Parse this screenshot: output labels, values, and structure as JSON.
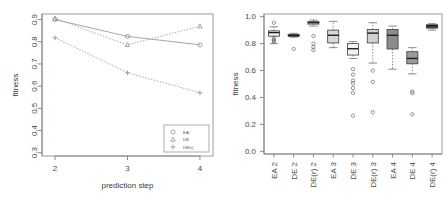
{
  "figure": {
    "background": "#ffffff",
    "panels": [
      "line-chart",
      "box-plot"
    ]
  },
  "chart_data": [
    {
      "type": "line",
      "title": "",
      "xlabel": "prediction step",
      "ylabel": "fitness",
      "x": [
        2,
        3,
        4
      ],
      "xticks": [
        "2",
        "3",
        "4"
      ],
      "yticks": [
        "0.3",
        "0.4",
        "0.5",
        "0.6",
        "0.7",
        "0.8",
        "0.9"
      ],
      "xlim": [
        1.82,
        4.18
      ],
      "ylim": [
        0.285,
        0.925
      ],
      "grid": false,
      "legend_position": "bottom-right",
      "series": [
        {
          "name": "EA",
          "values": [
            0.9,
            0.824,
            0.786
          ],
          "style": "solid",
          "marker": "circle"
        },
        {
          "name": "DE",
          "values": [
            0.905,
            0.786,
            0.87
          ],
          "style": "dotted",
          "marker": "triangle"
        },
        {
          "name": "DE(r)",
          "values": [
            0.818,
            0.66,
            0.57
          ],
          "style": "dotted",
          "marker": "plus"
        }
      ]
    },
    {
      "type": "box",
      "title": "",
      "xlabel": "",
      "ylabel": "fitness",
      "yticks": [
        "0.0",
        "0.2",
        "0.4",
        "0.6",
        "0.8",
        "1.0"
      ],
      "ylim": [
        -0.02,
        1.02
      ],
      "grid": false,
      "categories": [
        "EA 2",
        "DE 2",
        "DE(r) 2",
        "EA 3",
        "DE 3",
        "DE(r) 3",
        "EA 4",
        "DE 4",
        "DE(r) 4"
      ],
      "boxes": [
        {
          "label": "EA 2",
          "min": 0.8,
          "q1": 0.855,
          "median": 0.882,
          "q3": 0.895,
          "max": 0.925,
          "fill": "#f0f0f0",
          "outliers": [
            0.955,
            0.845,
            0.83,
            0.822,
            0.812
          ]
        },
        {
          "label": "DE 2",
          "min": 0.848,
          "q1": 0.855,
          "median": 0.86,
          "q3": 0.868,
          "max": 0.876,
          "fill": "#585858",
          "outliers": [
            0.76
          ]
        },
        {
          "label": "DE(r) 2",
          "min": 0.93,
          "q1": 0.945,
          "median": 0.955,
          "q3": 0.965,
          "max": 0.975,
          "fill": "#ffffff",
          "outliers": [
            0.855,
            0.8,
            0.775,
            0.752
          ]
        },
        {
          "label": "EA 3",
          "min": 0.77,
          "q1": 0.805,
          "median": 0.862,
          "q3": 0.9,
          "max": 0.965,
          "fill": "#d8d8d8",
          "outliers": []
        },
        {
          "label": "DE 3",
          "min": 0.69,
          "q1": 0.715,
          "median": 0.762,
          "q3": 0.8,
          "max": 0.815,
          "fill": "#f2f2f2",
          "outliers": [
            0.61,
            0.57,
            0.525,
            0.505,
            0.47,
            0.435,
            0.265
          ]
        },
        {
          "label": "DE(r) 3",
          "min": 0.655,
          "q1": 0.805,
          "median": 0.878,
          "q3": 0.905,
          "max": 0.955,
          "fill": "#d0d0d0",
          "outliers": [
            0.6,
            0.515,
            0.29
          ]
        },
        {
          "label": "EA 4",
          "min": 0.61,
          "q1": 0.76,
          "median": 0.862,
          "q3": 0.905,
          "max": 0.93,
          "fill": "#8c8c8c",
          "outliers": []
        },
        {
          "label": "DE 4",
          "min": 0.575,
          "q1": 0.65,
          "median": 0.69,
          "q3": 0.74,
          "max": 0.77,
          "fill": "#9a9a9a",
          "outliers": [
            0.445,
            0.432,
            0.275
          ]
        },
        {
          "label": "DE(r) 4",
          "min": 0.9,
          "q1": 0.915,
          "median": 0.932,
          "q3": 0.94,
          "max": 0.948,
          "fill": "#4e4e4e",
          "outliers": []
        }
      ]
    }
  ]
}
